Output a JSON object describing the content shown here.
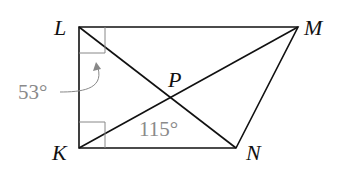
{
  "diagram": {
    "type": "geometry",
    "points": {
      "L": {
        "label": "L",
        "x": 79,
        "y": 27
      },
      "M": {
        "label": "M",
        "x": 298,
        "y": 27
      },
      "K": {
        "label": "K",
        "x": 79,
        "y": 148
      },
      "N": {
        "label": "N",
        "x": 236,
        "y": 148
      },
      "P": {
        "label": "P",
        "x": 171,
        "y": 98
      }
    },
    "segments": [
      "LM",
      "MN",
      "NK",
      "KL",
      "LN",
      "KM"
    ],
    "right_angles": [
      "L",
      "K"
    ],
    "angles": {
      "annotation_53": "53°",
      "annotation_115": "115°"
    },
    "colors": {
      "line": "#111111",
      "annotation": "#8a8a8a"
    }
  }
}
